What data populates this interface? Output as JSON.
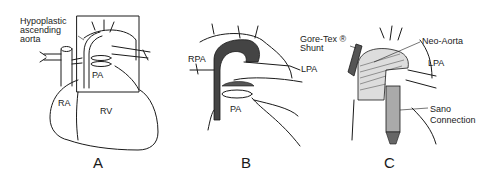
{
  "figure": {
    "panels": [
      {
        "id": "A",
        "label": "A",
        "annotations": {
          "hypoplastic": [
            "Hypoplastic",
            "ascending",
            "aorta"
          ],
          "pa": "PA",
          "ra": "RA",
          "rv": "RV"
        }
      },
      {
        "id": "B",
        "label": "B",
        "annotations": {
          "rpa": "RPA",
          "lpa": "LPA",
          "pa": "PA"
        }
      },
      {
        "id": "C",
        "label": "C",
        "annotations": {
          "goretex": [
            "Gore-Tex ®",
            "Shunt"
          ],
          "neoaorta": "Neo-Aorta",
          "lpa": "LPA",
          "sano": [
            "Sano",
            "Connection"
          ]
        }
      }
    ]
  }
}
